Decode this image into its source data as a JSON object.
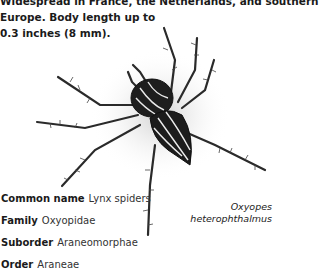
{
  "description": {
    "lines": [
      "Widespread in France, the Netherlands, and southern",
      "Europe. Body length up to",
      "0.3 inches (8 mm)."
    ]
  },
  "illustration": {
    "subject": "spider-illustration",
    "caption_lines": [
      "Oxyopes",
      "heterophthalmus"
    ]
  },
  "facts": [
    {
      "key": "Common name",
      "value": "Lynx spiders"
    },
    {
      "key": "Family",
      "value": "Oxyopidae"
    },
    {
      "key": "Suborder",
      "value": "Araneomorphae"
    },
    {
      "key": "Order",
      "value": "Araneae"
    }
  ]
}
